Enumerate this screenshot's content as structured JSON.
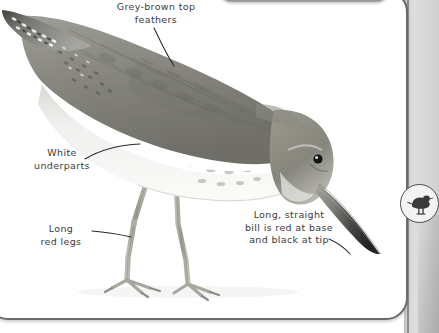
{
  "page": {
    "type": "field-guide-page",
    "background_color": "#ffffff",
    "border_color": "#6a6a6a",
    "gutter_color": "#d8d8d8"
  },
  "annotations": [
    {
      "id": "top-feathers",
      "text": "Grey-brown top\nfeathers",
      "target": "upper back / mantle"
    },
    {
      "id": "white-underparts",
      "text": "White\nunderparts",
      "target": "belly"
    },
    {
      "id": "red-legs",
      "text": "Long\nred legs",
      "target": "left leg"
    },
    {
      "id": "bill",
      "text": "Long, straight\nbill is red at base\nand black at tip",
      "target": "bill"
    }
  ],
  "badge": {
    "icon": "wading-bird-silhouette-icon",
    "fill_color": "#3a3a3a",
    "background_color": "#f3f3f3",
    "border_color": "#4c4c4c"
  },
  "illustration": {
    "name": "bird-illustration",
    "pose": "head-down foraging",
    "colors": {
      "upperparts": "#8d8c88",
      "upperparts_dark": "#6e6d69",
      "underparts": "#f4f4f2",
      "breast_speckles": "#a9a8a4",
      "bill_base": "#9a9a98",
      "bill_tip": "#2e2e2e",
      "legs": "#a5a49c",
      "eye": "#1a1a1a",
      "tail_bars": "#4a4a48"
    }
  }
}
